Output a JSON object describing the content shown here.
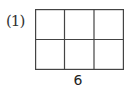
{
  "problem": {
    "label": "(1)",
    "grid": {
      "rows": 2,
      "cols": 3,
      "line_color": "#444444"
    },
    "bottom_label": "6"
  }
}
